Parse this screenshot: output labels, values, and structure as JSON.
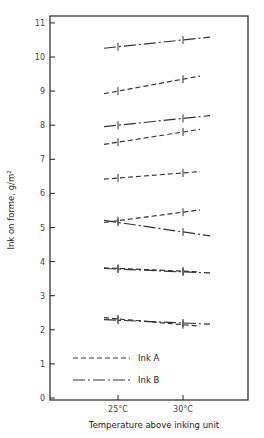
{
  "chart_data": {
    "type": "line",
    "title": "",
    "xlabel": "Temperature above inking unit",
    "ylabel": "Ink on forme,   g/m²",
    "x": [
      "25°C",
      "30°C"
    ],
    "x_ticks": [
      "25°C",
      "30°C"
    ],
    "y_ticks": [
      "0",
      "1",
      "2",
      "3",
      "4",
      "5",
      "6",
      "7",
      "8",
      "9",
      "10",
      "11"
    ],
    "ylim": [
      0,
      11
    ],
    "grid": false,
    "legend_position": "lower left inside",
    "legend": [
      {
        "label": "Ink A",
        "style": "dashed"
      },
      {
        "label": "Ink B",
        "style": "dash-dot"
      }
    ],
    "series": [
      {
        "name": "Ink B",
        "style": "dash-dot",
        "values": [
          10.3,
          10.5
        ]
      },
      {
        "name": "Ink A",
        "style": "dashed",
        "values": [
          9.0,
          9.35
        ]
      },
      {
        "name": "Ink B",
        "style": "dash-dot",
        "values": [
          8.0,
          8.2
        ]
      },
      {
        "name": "Ink A",
        "style": "dashed",
        "values": [
          7.5,
          7.8
        ]
      },
      {
        "name": "Ink A",
        "style": "dashed",
        "values": [
          6.45,
          6.6
        ]
      },
      {
        "name": "Ink A",
        "style": "dashed",
        "values": [
          5.2,
          5.45
        ]
      },
      {
        "name": "Ink B",
        "style": "dash-dot",
        "values": [
          5.15,
          4.87
        ]
      },
      {
        "name": "Ink A",
        "style": "dashed",
        "values": [
          3.8,
          3.72
        ]
      },
      {
        "name": "Ink B",
        "style": "dash-dot",
        "values": [
          3.78,
          3.7
        ]
      },
      {
        "name": "Ink A",
        "style": "dashed",
        "values": [
          2.32,
          2.15
        ]
      },
      {
        "name": "Ink B",
        "style": "dash-dot",
        "values": [
          2.28,
          2.2
        ]
      }
    ]
  },
  "colors": {
    "ink": "#333333",
    "axis": "#222222",
    "background": "#ffffff"
  }
}
